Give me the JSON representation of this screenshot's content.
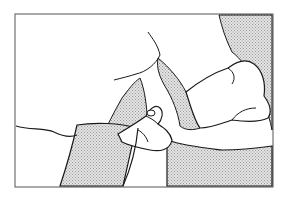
{
  "illustration": {
    "description": "Line drawing of two hands pinching a fold of skin/fabric, with stippled shaded regions, inside a rectangular frame",
    "frame": {
      "x": 15,
      "y": 14,
      "width": 258,
      "height": 173
    },
    "colors": {
      "background": "#ffffff",
      "line": "#1a1a1a",
      "shade": "#cfcfcf",
      "frame": "#555555"
    }
  }
}
